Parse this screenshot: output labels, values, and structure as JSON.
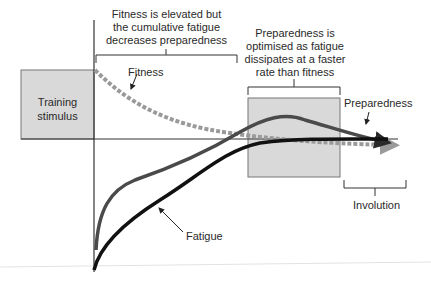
{
  "diagram": {
    "training_box": {
      "label_line1": "Training",
      "label_line2": "stimulus"
    },
    "annotations": {
      "top_left": {
        "line1": "Fitness is elevated but",
        "line2": "the cumulative fatigue",
        "line3": "decreases preparedness"
      },
      "top_right": {
        "line1": "Preparedness is",
        "line2": "optimised as fatigue",
        "line3": "dissipates at a faster",
        "line4": "rate than fitness"
      },
      "involution": "Involution"
    },
    "curves": {
      "fitness": {
        "label": "Fitness",
        "style": "dashed",
        "color": "#9a9a9a"
      },
      "preparedness": {
        "label": "Preparedness",
        "style": "solid",
        "color": "#4a4a4a"
      },
      "fatigue": {
        "label": "Fatigue",
        "style": "solid",
        "color": "#111111"
      }
    },
    "colors": {
      "box_fill": "#d9d9d9",
      "box_stroke": "#777777",
      "axis": "#333333"
    }
  }
}
